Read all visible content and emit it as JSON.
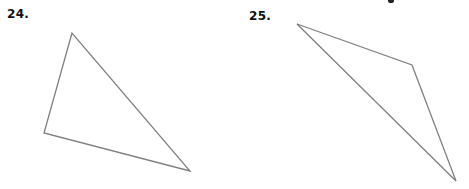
{
  "problems": [
    {
      "number_label": "24.",
      "shape": "triangle",
      "vertices": [
        [
          72,
          33
        ],
        [
          44,
          133
        ],
        [
          190,
          171
        ]
      ]
    },
    {
      "number_label": "25.",
      "shape": "triangle",
      "vertices": [
        [
          297,
          24
        ],
        [
          412,
          65
        ],
        [
          456,
          181
        ]
      ]
    }
  ],
  "style": {
    "stroke_color": "#808080",
    "stroke_width": 1.3,
    "label_color": "#111111"
  }
}
